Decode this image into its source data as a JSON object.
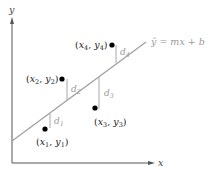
{
  "diagram": {
    "axes": {
      "x_label": "x",
      "y_label": "y"
    },
    "line": {
      "equation_hat": "ŷ",
      "equation_rest": " = mx + b",
      "color": "#a0a0a0"
    },
    "points": [
      {
        "label_x": "x",
        "sub_x": "1",
        "label_y": "y",
        "sub_y": "1",
        "deviation": "d",
        "dsub": "1"
      },
      {
        "label_x": "x",
        "sub_x": "2",
        "label_y": "y",
        "sub_y": "2",
        "deviation": "d",
        "dsub": "2"
      },
      {
        "label_x": "x",
        "sub_x": "3",
        "label_y": "y",
        "sub_y": "3",
        "deviation": "d",
        "dsub": "3"
      },
      {
        "label_x": "x",
        "sub_x": "4",
        "label_y": "y",
        "sub_y": "4",
        "deviation": "d",
        "dsub": "4"
      }
    ],
    "colors": {
      "axis": "#555555",
      "point": "#000000",
      "deviation": "#a8a8a8",
      "text": "#222222"
    }
  }
}
